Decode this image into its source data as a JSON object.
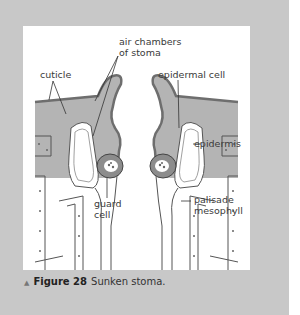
{
  "figure": {
    "labels": {
      "air_chambers_line1": "air chambers",
      "air_chambers_line2": "of stoma",
      "cuticle": "cuticle",
      "epidermal_cell": "epidermal cell",
      "epidermis": "epidermis",
      "palisade_line1": "palisade",
      "palisade_line2": "mesophyll",
      "guard_line1": "guard",
      "guard_line2": "cell"
    },
    "colors": {
      "panel_bg": "#c8c8c8",
      "figure_bg": "#ffffff",
      "tissue_gray": "#b4b4b4",
      "cuticle_dark": "#6e6e6e",
      "guard_cell": "#8c8c8c"
    }
  },
  "caption": {
    "marker": "▲",
    "number": "Figure 28",
    "text": "Sunken stoma."
  }
}
